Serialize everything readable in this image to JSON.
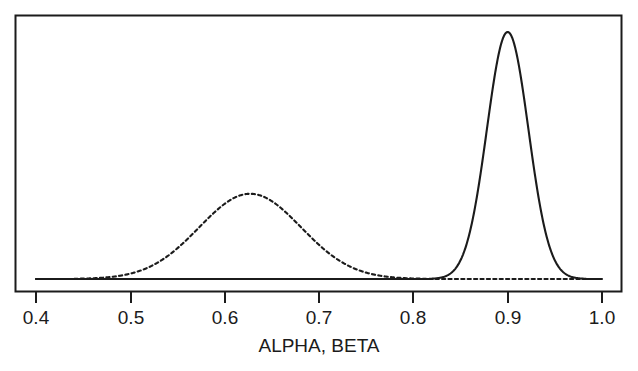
{
  "chart_data": {
    "type": "line",
    "title": "",
    "subtitle": "",
    "xlabel": "ALPHA, BETA",
    "ylabel": "",
    "xlim": [
      0.4,
      1.0
    ],
    "ylim": [
      0,
      1.0
    ],
    "grid": false,
    "legend": false,
    "axis_frame": "box",
    "xticks": [
      0.4,
      0.5,
      0.6,
      0.7,
      0.8,
      0.9,
      1.0
    ],
    "xtick_labels": [
      "0.4",
      "0.5",
      "0.6",
      "0.7",
      "0.8",
      "0.9",
      "1.0"
    ],
    "yticks": [],
    "ytick_labels": [],
    "annotations": [],
    "series": [
      {
        "name": "ALPHA",
        "linestyle": "dashed",
        "color": "#1b1b1b",
        "distribution": "gaussian",
        "mean": 0.627,
        "sigma": 0.054,
        "peak_height": 0.345,
        "x": [
          0.4,
          0.42,
          0.44,
          0.46,
          0.48,
          0.5,
          0.52,
          0.54,
          0.56,
          0.58,
          0.6,
          0.62,
          0.627,
          0.64,
          0.66,
          0.68,
          0.7,
          0.72,
          0.74,
          0.76,
          0.78,
          0.8,
          0.82,
          0.84,
          0.86,
          0.88,
          0.9,
          0.94,
          1.0
        ],
        "y": [
          0.0,
          0.001,
          0.003,
          0.008,
          0.02,
          0.043,
          0.082,
          0.137,
          0.204,
          0.271,
          0.322,
          0.344,
          0.345,
          0.34,
          0.312,
          0.262,
          0.2,
          0.138,
          0.085,
          0.046,
          0.022,
          0.009,
          0.003,
          0.001,
          0.0,
          0.0,
          0.0,
          0.0,
          0.0
        ]
      },
      {
        "name": "BETA",
        "linestyle": "solid",
        "color": "#1b1b1b",
        "distribution": "gaussian",
        "mean": 0.9,
        "sigma": 0.022,
        "peak_height": 1.0,
        "x": [
          0.4,
          0.6,
          0.75,
          0.8,
          0.82,
          0.84,
          0.85,
          0.86,
          0.87,
          0.88,
          0.89,
          0.9,
          0.91,
          0.92,
          0.93,
          0.94,
          0.95,
          0.96,
          0.97,
          0.98,
          1.0
        ],
        "y": [
          0.0,
          0.0,
          0.0,
          0.002,
          0.01,
          0.042,
          0.079,
          0.176,
          0.329,
          0.551,
          0.797,
          1.0,
          0.797,
          0.551,
          0.329,
          0.176,
          0.079,
          0.042,
          0.01,
          0.002,
          0.0
        ]
      }
    ]
  },
  "axis": {
    "title": "ALPHA, BETA",
    "tick_labels": [
      "0.4",
      "0.5",
      "0.6",
      "0.7",
      "0.8",
      "0.9",
      "1.0"
    ]
  },
  "style": {
    "background": "#ffffff",
    "ink": "#1b1b1b",
    "frame_color": "#1b1b1b"
  }
}
